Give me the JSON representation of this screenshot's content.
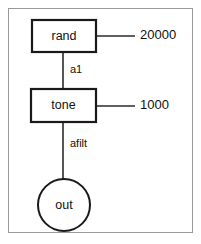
{
  "diagram": {
    "type": "signal-flow",
    "title": "",
    "background": "#ffffff",
    "frame_color": "#9a9a9a",
    "node_stroke": "#1a1a1a",
    "edge_color": "#2b2b2b",
    "nodes": [
      {
        "id": "rand",
        "label": "rand",
        "shape": "rectangle",
        "x": 32,
        "y": 20,
        "width": 64,
        "height": 32
      },
      {
        "id": "tone",
        "label": "tone",
        "shape": "rectangle",
        "x": 31,
        "y": 89,
        "width": 65,
        "height": 33
      },
      {
        "id": "out",
        "label": "out",
        "shape": "circle",
        "cx": 64,
        "cy": 205,
        "r": 26
      }
    ],
    "edges": [
      {
        "id": "rand-to-tone",
        "from": "rand",
        "to": "tone",
        "label": "a1",
        "label_x": 70,
        "label_y": 70,
        "x": 63,
        "y1": 52,
        "y2": 89
      },
      {
        "id": "tone-to-out",
        "from": "tone",
        "to": "out",
        "label": "afilt",
        "label_x": 70,
        "label_y": 144,
        "x": 63,
        "y1": 122,
        "y2": 179
      }
    ],
    "parameters": [
      {
        "id": "rand-amplitude",
        "value": "20000",
        "attached_to": "rand",
        "stub_x1": 96,
        "stub_x2": 135,
        "stub_y": 36,
        "label_x": 140,
        "label_y": 36
      },
      {
        "id": "tone-cutoff",
        "value": "1000",
        "attached_to": "tone",
        "stub_x1": 96,
        "stub_x2": 135,
        "stub_y": 106,
        "label_x": 140,
        "label_y": 106
      }
    ]
  }
}
